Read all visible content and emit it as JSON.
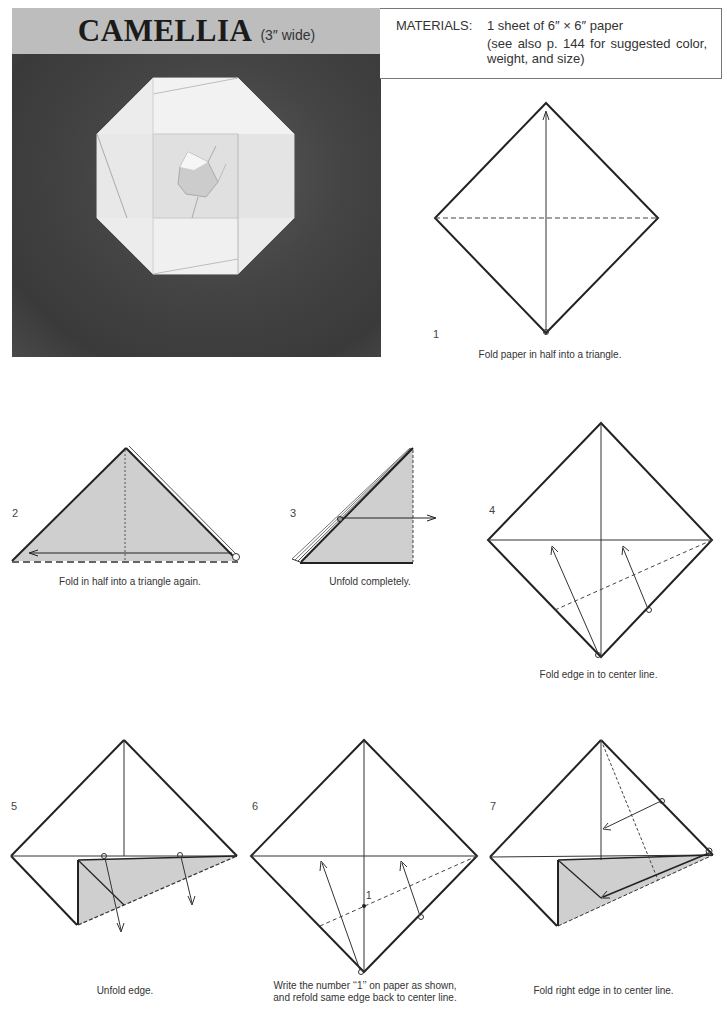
{
  "header": {
    "title": "CAMELLIA",
    "subtitle": "(3″ wide)"
  },
  "materials": {
    "label": "MATERIALS:",
    "line1": "1 sheet of 6″ × 6″ paper",
    "line2": "(see also p. 144 for suggested color, weight, and size)"
  },
  "photo": {
    "subject": "folded-camellia-photo"
  },
  "colors": {
    "shade": "#cfcfcf",
    "line": "#222222",
    "title_band": "#bdbdbd",
    "photo_bg": "#444444"
  },
  "steps": [
    {
      "number": "1",
      "caption": "Fold paper in half into a triangle."
    },
    {
      "number": "2",
      "caption": "Fold in half into a triangle again."
    },
    {
      "number": "3",
      "caption": "Unfold completely."
    },
    {
      "number": "4",
      "caption": "Fold edge in to center line."
    },
    {
      "number": "5",
      "caption": "Unfold edge."
    },
    {
      "number": "6",
      "caption_line1": "Write the number ‘‘1’’ on paper as shown,",
      "caption_line2": "and refold same edge back to center line.",
      "marker": "1"
    },
    {
      "number": "7",
      "caption": "Fold right edge in to center line."
    }
  ]
}
